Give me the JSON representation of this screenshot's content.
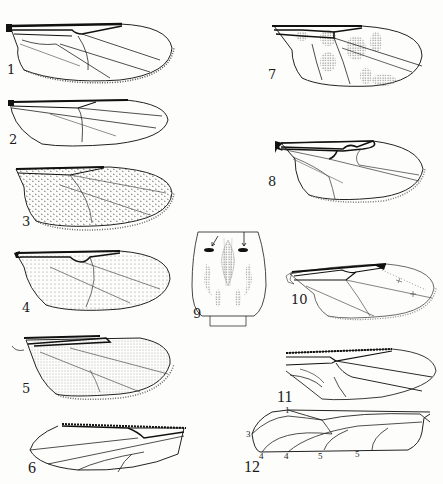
{
  "plate": {
    "background": "#fdfdfc",
    "ink": "#1a1a1a",
    "figures": [
      {
        "id": 1,
        "label": "1",
        "subject": "wing",
        "pattern": "clear"
      },
      {
        "id": 2,
        "label": "2",
        "subject": "wing",
        "pattern": "clear"
      },
      {
        "id": 3,
        "label": "3",
        "subject": "wing",
        "pattern": "setulose-dotted"
      },
      {
        "id": 4,
        "label": "4",
        "subject": "wing",
        "pattern": "dotted-apical"
      },
      {
        "id": 5,
        "label": "5",
        "subject": "wing",
        "pattern": "stippled"
      },
      {
        "id": 6,
        "label": "6",
        "subject": "wing",
        "pattern": "clear-mirrored"
      },
      {
        "id": 7,
        "label": "7",
        "subject": "wing",
        "pattern": "spotted-infuscated"
      },
      {
        "id": 8,
        "label": "8",
        "subject": "wing",
        "pattern": "clear-dark-stigma"
      },
      {
        "id": 9,
        "label": "9",
        "subject": "thorax (scutum) dorsal view",
        "pattern": "markings with arrows"
      },
      {
        "id": 10,
        "label": "10",
        "subject": "wing",
        "pattern": "clear-dark-costal"
      },
      {
        "id": 11,
        "label": "11",
        "subject": "wing",
        "pattern": "clear"
      },
      {
        "id": 12,
        "label": "12",
        "subject": "wing venation diagram",
        "pattern": "vein-numbered",
        "vein_labels": [
          "1",
          "3",
          "4",
          "4",
          "5",
          "5"
        ]
      }
    ]
  }
}
